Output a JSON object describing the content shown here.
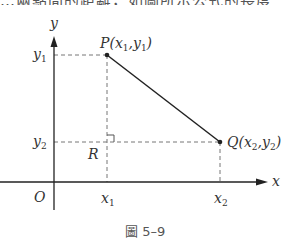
{
  "top_text": "…兩點間的距離，如圖所示公式的長度",
  "figure": {
    "caption": "圖 5–9",
    "axes": {
      "x_label": "x",
      "y_label": "y",
      "origin_label": "O"
    },
    "points": {
      "P": {
        "label": "P(x",
        "sub1": "1",
        "mid": ",y",
        "sub2": "1",
        "end": ")"
      },
      "Q": {
        "label": "Q(x",
        "sub1": "2",
        "mid": ",y",
        "sub2": "2",
        "end": ")"
      },
      "R": {
        "label": "R"
      }
    },
    "ticks": {
      "y1": {
        "base": "y",
        "sub": "1"
      },
      "y2": {
        "base": "y",
        "sub": "2"
      },
      "x1": {
        "base": "x",
        "sub": "1"
      },
      "x2": {
        "base": "x",
        "sub": "2"
      }
    },
    "colors": {
      "line": "#222222",
      "dash": "#777777",
      "text": "#333333"
    }
  }
}
